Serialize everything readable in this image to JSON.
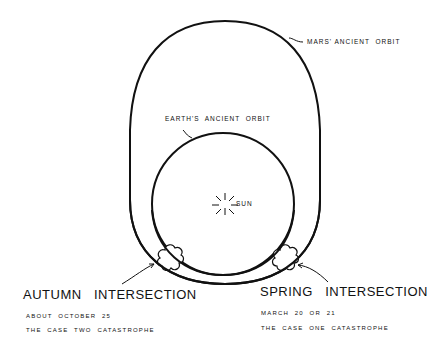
{
  "diagram": {
    "labels": {
      "mars_orbit": "MARS' ANCIENT  ORBIT",
      "earth_orbit": "EARTH'S  ANCIENT  ORBIT",
      "sun": "SUN"
    },
    "autumn": {
      "title": "AUTUMN   INTERSECTION",
      "date": "ABOUT  OCTOBER  25",
      "case": "THE  CASE  TWO  CATASTROPHE"
    },
    "spring": {
      "title": "SPRING   INTERSECTION",
      "date": "MARCH  20  OR  21",
      "case": "THE  CASE  ONE  CATASTROPHE"
    },
    "colors": {
      "line": "#111111",
      "background": "#ffffff"
    }
  }
}
